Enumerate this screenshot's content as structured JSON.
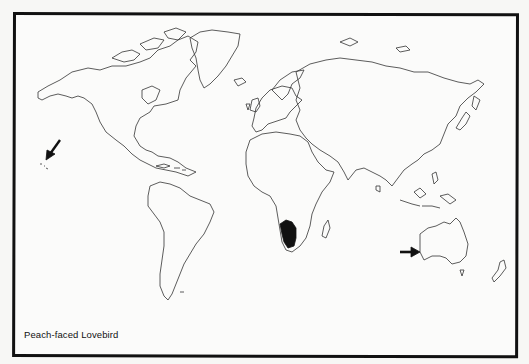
{
  "map": {
    "title": "Peach-faced Lovebird",
    "type": "world distribution map",
    "native_range": {
      "region": "southwestern Africa",
      "fill_color": "#111111"
    },
    "introduced_markers": [
      {
        "location": "Hawaii",
        "marker": "arrow",
        "direction": "down-left"
      },
      {
        "location": "southwestern Australia",
        "marker": "arrow",
        "direction": "right"
      }
    ],
    "colors": {
      "land_outline": "#333333",
      "frame": "#111111",
      "background": "#fbfbfa"
    }
  }
}
